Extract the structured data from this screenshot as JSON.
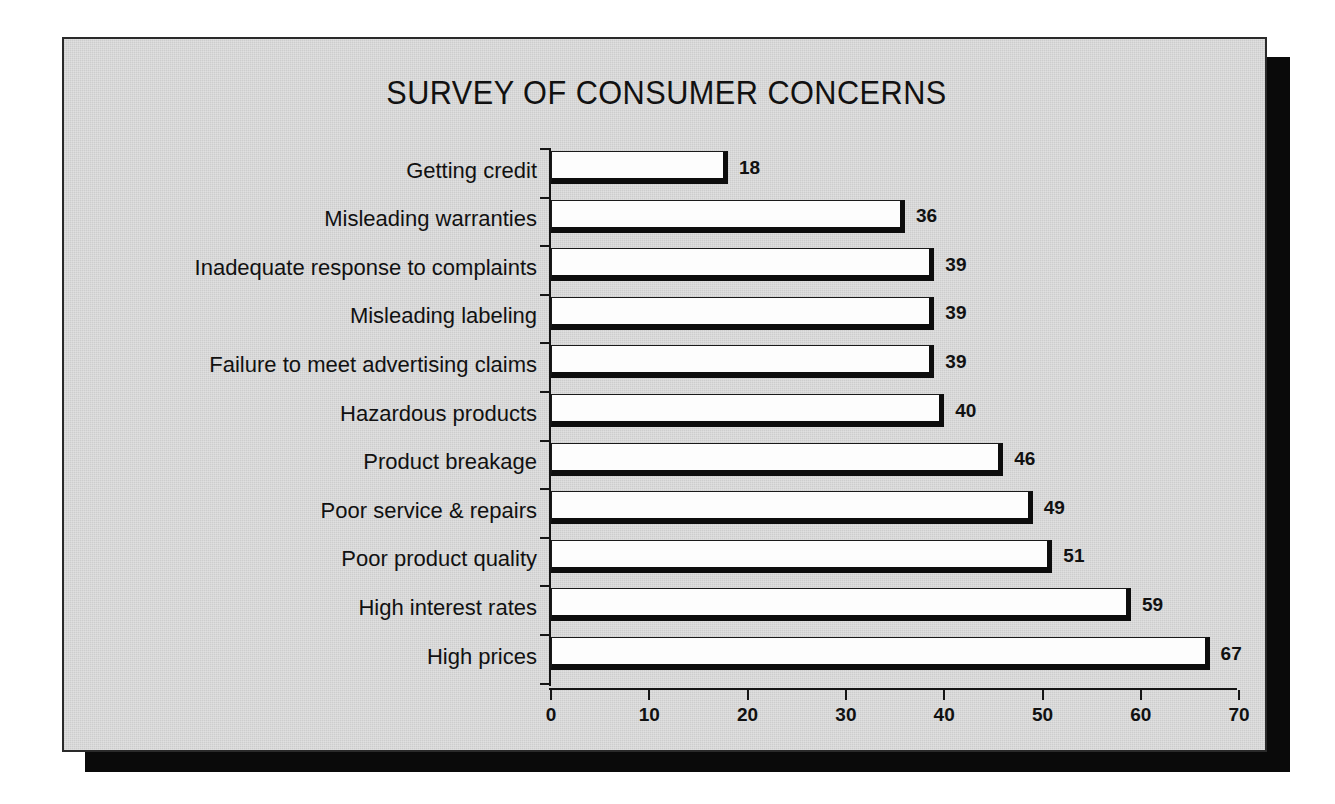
{
  "chart_data": {
    "type": "bar",
    "orientation": "horizontal",
    "title": "SURVEY OF CONSUMER CONCERNS",
    "xlabel": "",
    "ylabel": "",
    "xlim": [
      0,
      70
    ],
    "xticks": [
      0,
      10,
      20,
      30,
      40,
      50,
      60,
      70
    ],
    "xtick_labels": [
      "0",
      "10",
      "20",
      "30",
      "40",
      "50",
      "60",
      "70"
    ],
    "grid": false,
    "legend": false,
    "value_labels": true,
    "categories": [
      "Getting credit",
      "Misleading warranties",
      "Inadequate response to complaints",
      "Misleading labeling",
      "Failure to meet advertising claims",
      "Hazardous products",
      "Product breakage",
      "Poor service & repairs",
      "Poor product quality",
      "High interest rates",
      "High prices"
    ],
    "values": [
      18,
      36,
      39,
      39,
      39,
      40,
      46,
      49,
      51,
      59,
      67
    ],
    "value_label_texts": [
      "18",
      "36",
      "39",
      "39",
      "39",
      "40",
      "46",
      "49",
      "51",
      "59",
      "67"
    ],
    "colors": {
      "panel_background": "#d4d4d4",
      "page_background": "#ffffff",
      "bar_fill": "#fdfdfd",
      "bar_outline": "#0d0d0d",
      "axis": "#141414",
      "text": "#111111",
      "panel_shadow": "#0a0a0a"
    }
  }
}
